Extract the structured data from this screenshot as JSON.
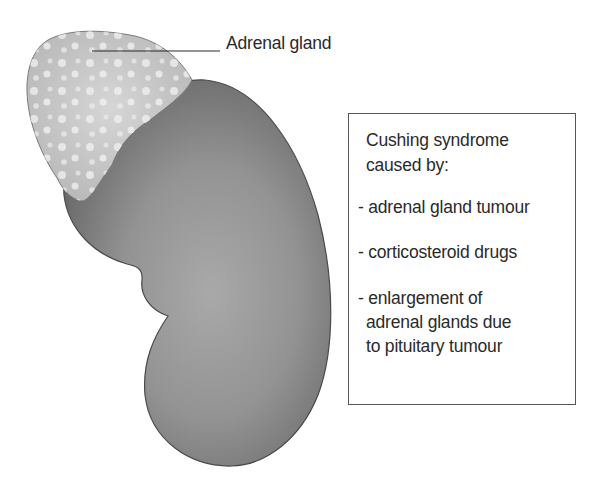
{
  "figure": {
    "labels": {
      "adrenal_gland": "Adrenal gland"
    },
    "infobox": {
      "title_line1": "Cushing syndrome",
      "title_line2": "caused by:",
      "items": [
        {
          "line1": "- adrenal gland tumour"
        },
        {
          "line1": "- corticosteroid drugs"
        },
        {
          "line1": "- enlargement of",
          "line2": "adrenal glands due",
          "line3": "to pituitary tumour"
        }
      ]
    },
    "colors": {
      "kidney_dark": "#6e6e6e",
      "kidney_light": "#a9a9a9",
      "adrenal_fill": "#c4c4c4",
      "adrenal_highlight": "#eeeeee",
      "text": "#2a2a2a",
      "box_border": "#555555"
    }
  }
}
